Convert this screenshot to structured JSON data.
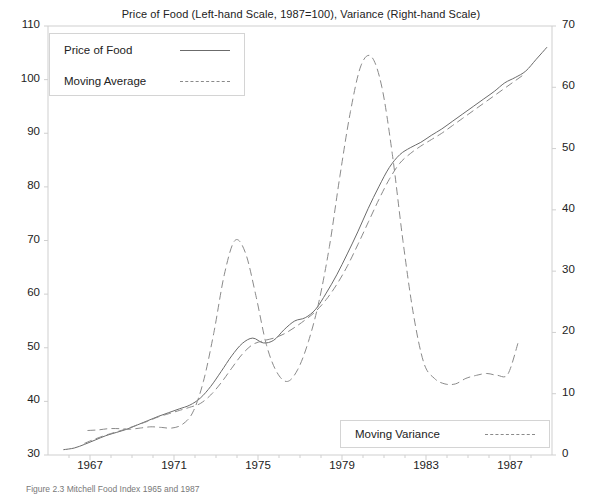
{
  "chart_data": {
    "type": "line",
    "title": "Price of Food (Left-hand Scale, 1987=100), Variance (Right-hand Scale)",
    "xlabel": "",
    "ylabel": "",
    "ylabel_right": "",
    "xlim": [
      1965.0,
      1989.0
    ],
    "ylim": [
      30,
      110
    ],
    "ylim_right": [
      0,
      70
    ],
    "grid": false,
    "legend_position": "upper-left and lower-right",
    "x_ticks": [
      1967,
      1971,
      1975,
      1979,
      1983,
      1987
    ],
    "y_ticks_left": [
      30,
      40,
      50,
      60,
      70,
      80,
      90,
      100,
      110
    ],
    "y_ticks_right": [
      0,
      10,
      20,
      30,
      40,
      50,
      60,
      70
    ],
    "series": [
      {
        "name": "Price of Food",
        "style": "solid",
        "axis": "left",
        "color": "#6b6b6b",
        "x": [
          1965.75,
          1966.25,
          1966.75,
          1967.25,
          1967.75,
          1968.25,
          1968.75,
          1969.25,
          1969.75,
          1970.25,
          1970.75,
          1971.25,
          1971.75,
          1972.25,
          1972.75,
          1973.25,
          1973.75,
          1974.25,
          1974.75,
          1975.25,
          1975.75,
          1976.25,
          1976.75,
          1977.25,
          1977.75,
          1978.25,
          1978.75,
          1979.25,
          1979.75,
          1980.25,
          1980.75,
          1981.25,
          1981.75,
          1982.25,
          1982.75,
          1983.25,
          1983.75,
          1984.25,
          1984.75,
          1985.25,
          1985.75,
          1986.25,
          1986.75,
          1987.25,
          1987.75,
          1988.25,
          1988.75
        ],
        "y": [
          31.0,
          31.3,
          32.0,
          32.8,
          33.6,
          34.2,
          34.8,
          35.6,
          36.4,
          37.2,
          37.9,
          38.6,
          39.3,
          40.6,
          42.8,
          45.6,
          48.5,
          50.8,
          51.8,
          50.9,
          51.4,
          53.4,
          55.0,
          55.6,
          57.2,
          60.2,
          63.6,
          67.5,
          71.6,
          76.0,
          80.0,
          83.6,
          86.0,
          87.3,
          88.3,
          89.6,
          90.8,
          92.2,
          93.6,
          95.0,
          96.4,
          97.8,
          99.4,
          100.4,
          101.6,
          103.8,
          106.0
        ]
      },
      {
        "name": "Moving Average",
        "style": "dashed",
        "axis": "left",
        "color": "#8a8a8a",
        "x": [
          1966.75,
          1967.25,
          1967.75,
          1968.25,
          1968.75,
          1969.25,
          1969.75,
          1970.25,
          1970.75,
          1971.25,
          1971.75,
          1972.25,
          1972.75,
          1973.25,
          1973.75,
          1974.25,
          1974.75,
          1975.25,
          1975.75,
          1976.25,
          1976.75,
          1977.25,
          1977.75,
          1978.25,
          1978.75,
          1979.25,
          1979.75,
          1980.25,
          1980.75,
          1981.25,
          1981.75,
          1982.25,
          1982.75,
          1983.25,
          1983.75,
          1984.25,
          1984.75,
          1985.25,
          1985.75,
          1986.25,
          1986.75,
          1987.25,
          1987.75
        ],
        "y": [
          32.2,
          33.0,
          33.7,
          34.3,
          34.9,
          35.6,
          36.3,
          37.1,
          37.7,
          38.3,
          38.9,
          39.6,
          41.2,
          43.5,
          46.2,
          48.8,
          50.6,
          51.3,
          51.8,
          52.6,
          53.8,
          55.2,
          56.8,
          59.0,
          61.8,
          65.2,
          69.2,
          73.4,
          77.6,
          81.4,
          84.4,
          86.2,
          87.6,
          88.8,
          90.0,
          91.4,
          92.8,
          94.2,
          95.6,
          97.0,
          98.4,
          99.8,
          101.2
        ]
      },
      {
        "name": "Moving Variance",
        "style": "dashed",
        "axis": "right",
        "color": "#8a8a8a",
        "x": [
          1966.9,
          1967.4,
          1967.9,
          1968.4,
          1968.9,
          1969.4,
          1969.9,
          1970.4,
          1970.9,
          1971.4,
          1971.9,
          1972.4,
          1972.9,
          1973.4,
          1973.9,
          1974.4,
          1974.9,
          1975.4,
          1975.9,
          1976.4,
          1976.9,
          1977.4,
          1977.9,
          1978.4,
          1978.9,
          1979.4,
          1979.9,
          1980.4,
          1980.9,
          1981.4,
          1981.9,
          1982.4,
          1982.9,
          1983.4,
          1983.9,
          1984.4,
          1984.9,
          1985.4,
          1985.9,
          1986.4,
          1986.9,
          1987.4
        ],
        "y": [
          4.0,
          4.1,
          4.3,
          4.3,
          4.2,
          4.4,
          4.6,
          4.5,
          4.4,
          5.0,
          7.0,
          12.0,
          20.0,
          29.5,
          35.0,
          33.0,
          26.0,
          18.0,
          13.5,
          12.0,
          14.0,
          18.5,
          25.0,
          34.0,
          45.5,
          56.0,
          63.5,
          65.0,
          60.0,
          49.0,
          35.0,
          23.0,
          15.0,
          12.5,
          11.6,
          11.6,
          12.5,
          13.0,
          13.3,
          13.0,
          13.2,
          18.5
        ]
      }
    ]
  },
  "legend_main": {
    "rows": [
      {
        "label": "Price of Food",
        "style": "solid"
      },
      {
        "label": "Moving Average",
        "style": "dashed"
      }
    ]
  },
  "legend_variance": {
    "rows": [
      {
        "label": "Moving Variance",
        "style": "dashed"
      }
    ]
  },
  "caption": "Figure 2.3   Mitchell Food Index 1965 and 1987",
  "colors": {
    "solid_line": "#6b6b6b",
    "dashed_line": "#8a8a8a",
    "axis": "#cfcfcf",
    "text": "#222222"
  }
}
